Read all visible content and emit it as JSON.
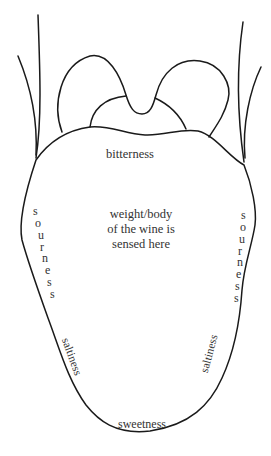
{
  "diagram": {
    "labels": {
      "bitterness": "bitterness",
      "center_line1": "weight/body",
      "center_line2": "of the wine is",
      "center_line3": "sensed here",
      "sourness_left": "sourness",
      "sourness_right": "sourness",
      "saltiness_left": "saltiness",
      "saltiness_right": "saltiness",
      "sweetness": "sweetness"
    },
    "colors": {
      "stroke": "#1a1a1a",
      "text": "#333333",
      "background": "#ffffff"
    }
  }
}
